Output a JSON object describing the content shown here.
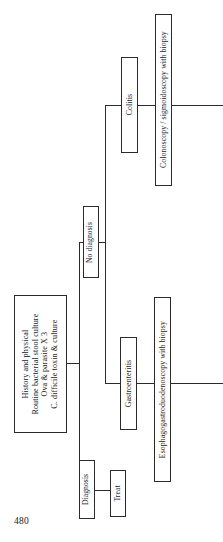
{
  "figure": {
    "orientation": "rotated-90-ccw",
    "type": "clinical-algorithm-flowchart",
    "line_color": "#2b2b2b",
    "background_color": "#ffffff",
    "nodes": {
      "root": {
        "lines": [
          "History and physical",
          "Routine bacterial stool culture",
          "Ova & parasite X 3",
          "C. difficile toxin & culture"
        ]
      },
      "diagnosis": {
        "label": "Diagnosis"
      },
      "treat": {
        "label": "Treat"
      },
      "no_diagnosis": {
        "label": "No diagnosis"
      },
      "colitis": {
        "label": "Colitis"
      },
      "colonoscopy": {
        "label": "Colonoscopy / sigmoidoscopy with biopsy"
      },
      "gastroenteritis": {
        "label": "Gastroenteritis"
      },
      "egd": {
        "label": "Esophagogastroduodenoscopy with biopsy"
      }
    }
  },
  "page": {
    "number": "480"
  }
}
